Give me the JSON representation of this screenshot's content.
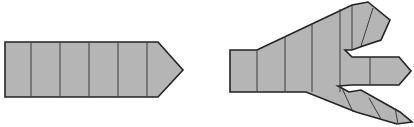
{
  "figure": {
    "title": "",
    "background_color": "#ffffff",
    "fill_color": "#b5b5b5",
    "outline_color": "#222222",
    "divider_color": "#3a3a3a",
    "outline_width": 1.6,
    "divider_width": 1.0,
    "canvas": {
      "width": 414,
      "height": 127
    },
    "shapes": [
      {
        "name": "straight-segmented-arrow",
        "label": "",
        "segment_count": 6,
        "outline": "5,42 158,42 183,70 158,97 5,97",
        "dividers": [
          "31,42 31,97",
          "60,42 60,97",
          "89,42 89,97",
          "118,42 118,97",
          "147,42 147,97"
        ]
      },
      {
        "name": "branching-three-prong-arrow",
        "label": "",
        "prong_count": 3,
        "outline": "230,50 257,50 352,5 368,2 390,20 381,40 363,46 352,50 345,50 352,57 399,57 411,71 399,85 352,85 338,86 349,92 361,90 400,112 412,122 397,124 356,112 306,92 257,92 230,92",
        "dividers": [
          "257,50 257,92",
          "285,36 285,92",
          "312,23 312,92",
          "340,9 340,92",
          "352,5 352,50",
          "360,46 372,8",
          "370,57 370,85",
          "340,86 352,112",
          "370,98 381,118",
          "396,108 397,124"
        ],
        "prongs": [
          {
            "name": "upper-prong",
            "direction": "up-right",
            "tip": "368,2 390,20 381,40"
          },
          {
            "name": "middle-prong",
            "direction": "right",
            "tip": "399,57 411,71 399,85"
          },
          {
            "name": "lower-prong",
            "direction": "down-right",
            "tip": "400,112 412,122 397,124"
          }
        ]
      }
    ]
  }
}
